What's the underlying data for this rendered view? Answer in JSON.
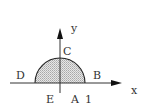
{
  "diagram": {
    "type": "coordinate-region",
    "axes": {
      "x_label": "x",
      "y_label": "y"
    },
    "region": {
      "shape": "semicircle",
      "fill": "#d4d4d4",
      "stroke": "#222222"
    },
    "points": {
      "A": "A",
      "B": "B",
      "C": "C",
      "D": "D",
      "E": "E"
    },
    "tick_label": "1"
  }
}
